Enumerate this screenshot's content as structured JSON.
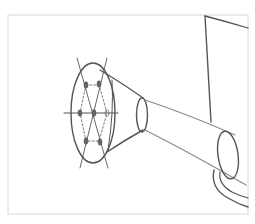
{
  "figure": {
    "subject": "Pencil sketch of a watering can spout with rose (sprinkler head)",
    "style": "hand-drawn pencil line art",
    "colors": {
      "background": "#ffffff",
      "frame": "#d8d8d8",
      "line": "#555555",
      "guide_line": "#6a6a6a"
    },
    "parts": {
      "rose": "rose-head-with-holes",
      "construction_lines": "axis-guides",
      "spout": "tapered-spout-tube",
      "can_body": "watering-can-body"
    },
    "hole_count": 7
  }
}
